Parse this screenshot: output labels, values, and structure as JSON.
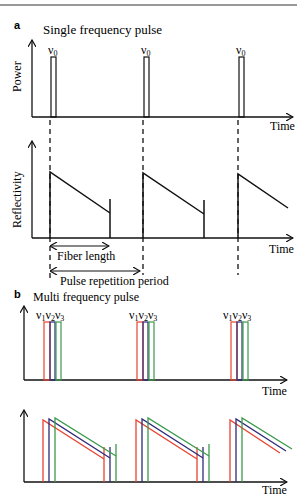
{
  "figure": {
    "panel_a": {
      "label": "a",
      "title": "Single frequency pulse",
      "top_plot": {
        "ylabel": "Power",
        "xlabel": "Time",
        "pulse_label": "ν",
        "pulse_sub": "0"
      },
      "bottom_plot": {
        "ylabel": "Reflectivity",
        "xlabel": "Time",
        "annotations": {
          "fiber_length": "Fiber length",
          "pulse_repetition_period": "Pulse repetition period"
        }
      }
    },
    "panel_b": {
      "label": "b",
      "title": "Multi frequency pulse",
      "top_plot": {
        "xlabel": "Time",
        "pulse_labels": [
          {
            "sym": "ν",
            "sub": "1"
          },
          {
            "sym": "ν",
            "sub": "2"
          },
          {
            "sym": "ν",
            "sub": "3"
          }
        ]
      },
      "bottom_plot": {
        "xlabel": "Time"
      }
    },
    "colors": {
      "axis": "#111111",
      "nu1": "#e8432e",
      "nu2": "#2e2a7a",
      "nu3": "#3a9a4a"
    }
  }
}
